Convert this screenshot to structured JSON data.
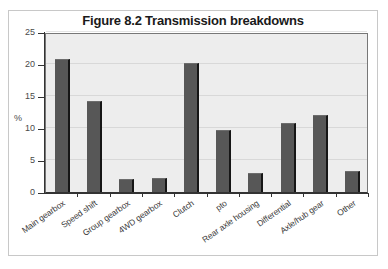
{
  "figure": {
    "title": "Figure 8.2 Transmission breakdowns"
  },
  "chart_data": {
    "type": "bar",
    "title": "Figure 8.2 Transmission breakdowns",
    "xlabel": "",
    "ylabel": "%",
    "ylim": [
      0,
      25
    ],
    "yticks": [
      0,
      5,
      10,
      15,
      20,
      25
    ],
    "ytick_labels": [
      "0",
      "5",
      "10",
      "15",
      "20",
      "25"
    ],
    "grid": false,
    "legend": false,
    "categories": [
      "Main gearbox",
      "Speed shift",
      "Group gearbox",
      "4WD gearbox",
      "Clutch",
      "pto",
      "Rear axle housing",
      "Differential",
      "Axle/hub gear",
      "Other"
    ],
    "values": [
      20.8,
      14.2,
      2.0,
      2.2,
      20.2,
      9.7,
      3.0,
      10.8,
      12.0,
      3.3
    ],
    "bar_color": "#575757",
    "plot_background": "#ededed",
    "axis_color": "#333333"
  }
}
